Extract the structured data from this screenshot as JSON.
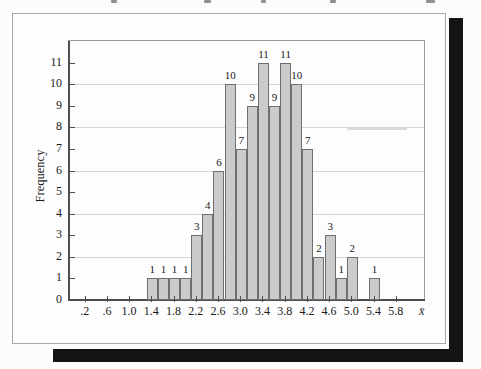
{
  "figure": {
    "kind": "textbook-histogram-figure",
    "ylabel": "Frequency",
    "x_axis_symbol": "x̄"
  },
  "chart_data": {
    "type": "bar",
    "title": "",
    "xlabel": "x̄",
    "ylabel": "Frequency",
    "bar_width": 0.2,
    "bar_centers": [
      1.4,
      1.6,
      1.8,
      2.0,
      2.2,
      2.4,
      2.6,
      2.8,
      3.0,
      3.2,
      3.4,
      3.6,
      3.8,
      4.0,
      4.2,
      4.4,
      4.6,
      4.8,
      5.0,
      5.2,
      5.4
    ],
    "values": [
      1,
      1,
      1,
      1,
      3,
      4,
      6,
      10,
      7,
      9,
      11,
      9,
      11,
      10,
      7,
      2,
      3,
      1,
      2,
      0,
      1
    ],
    "total_frequency": 100,
    "x_tick_values": [
      0.2,
      0.6,
      1.0,
      1.4,
      1.8,
      2.2,
      2.6,
      3.0,
      3.4,
      3.8,
      4.2,
      4.6,
      5.0,
      5.4,
      5.8
    ],
    "x_tick_labels": [
      ".2",
      ".6",
      "1.0",
      "1.4",
      "1.8",
      "2.2",
      "2.6",
      "3.0",
      "3.4",
      "3.8",
      "4.2",
      "4.6",
      "5.0",
      "5.4",
      "5.8"
    ],
    "y_ticks": [
      0,
      1,
      2,
      3,
      4,
      5,
      6,
      7,
      8,
      9,
      10,
      11
    ],
    "gridline_values": [
      2,
      4,
      6,
      8,
      10
    ],
    "xlim": [
      -0.1,
      6.29
    ],
    "ylim": [
      0,
      12
    ],
    "grid": "horizontal-light",
    "legend": "none",
    "colors": {
      "bar_fill": "#cbcbcb",
      "bar_border": "#6f6f6f",
      "gridline": "#d9d6cd",
      "axis": "#4e4e4e",
      "page_shadow": "#141414",
      "page_background": "#fdfdfd"
    }
  }
}
